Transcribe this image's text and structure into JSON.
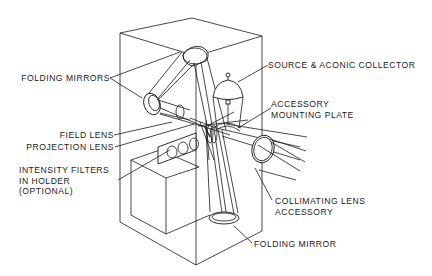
{
  "diagram": {
    "type": "optical-system-schematic",
    "labels": {
      "folding_mirrors": "FOLDING MIRRORS",
      "field_lens": "FIELD LENS",
      "projection_lens": "PROJECTION LENS",
      "intensity_filters_1": "INTENSITY FILTERS",
      "intensity_filters_2": "IN HOLDER",
      "intensity_filters_3": "(OPTIONAL)",
      "source_collector": "SOURCE & ACONIC COLLECTOR",
      "accessory_plate_1": "ACCESSORY",
      "accessory_plate_2": "MOUNTING PLATE",
      "collimating_1": "COLLIMATING LENS",
      "collimating_2": "ACCESSORY",
      "folding_mirror": "FOLDING MIRROR"
    },
    "colors": {
      "line": "#1a1a1a",
      "background": "#ffffff",
      "text": "#222222"
    }
  }
}
